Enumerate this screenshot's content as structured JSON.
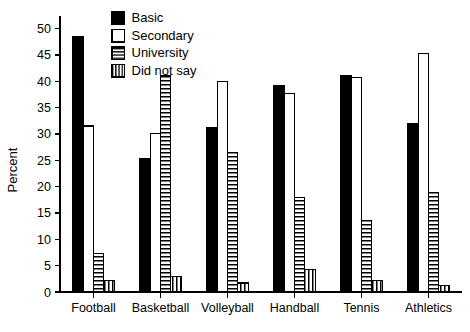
{
  "chart_data": {
    "type": "bar",
    "title": "",
    "xlabel": "",
    "ylabel": "Percent",
    "ylim": [
      0,
      52
    ],
    "yticks": [
      0,
      5,
      10,
      15,
      20,
      25,
      30,
      35,
      40,
      45,
      50
    ],
    "grid": false,
    "legend_position": "top-center",
    "categories": [
      "Football",
      "Basketball",
      "Volleyball",
      "Handball",
      "Tennis",
      "Athletics"
    ],
    "series": [
      {
        "name": "Basic",
        "pattern": "solid-black",
        "color": "#000000",
        "values": [
          48.5,
          25.3,
          31.2,
          39.2,
          41.1,
          32.0
        ]
      },
      {
        "name": "Secondary",
        "pattern": "empty-white",
        "color": "#ffffff",
        "values": [
          31.5,
          30.0,
          40.0,
          37.6,
          40.7,
          45.2
        ]
      },
      {
        "name": "University",
        "pattern": "horizontal-stripes",
        "color": "#ffffff",
        "values": [
          7.3,
          41.0,
          26.5,
          17.9,
          13.5,
          18.8
        ]
      },
      {
        "name": "Did not say",
        "pattern": "vertical-stripes",
        "color": "#ffffff",
        "values": [
          2.1,
          3.0,
          1.7,
          4.3,
          2.1,
          1.3
        ]
      }
    ]
  },
  "axis": {
    "y_title": "Percent",
    "y_tick_labels": [
      "0",
      "5",
      "10",
      "15",
      "20",
      "25",
      "30",
      "35",
      "40",
      "45",
      "50"
    ],
    "x_tick_labels": [
      "Football",
      "Basketball",
      "Volleyball",
      "Handball",
      "Tennis",
      "Athletics"
    ]
  },
  "legend": {
    "items": [
      {
        "label": "Basic"
      },
      {
        "label": "Secondary"
      },
      {
        "label": "University"
      },
      {
        "label": "Did not say"
      }
    ]
  }
}
